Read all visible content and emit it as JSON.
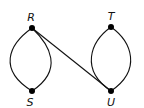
{
  "diagram": {
    "type": "graph",
    "nodes": [
      {
        "id": "R",
        "label": "R",
        "x": 32,
        "y": 28,
        "label_x": 31,
        "label_y": 21
      },
      {
        "id": "T",
        "label": "T",
        "x": 111,
        "y": 27,
        "label_x": 111,
        "label_y": 20
      },
      {
        "id": "S",
        "label": "S",
        "x": 32,
        "y": 91,
        "label_x": 30,
        "label_y": 106
      },
      {
        "id": "U",
        "label": "U",
        "x": 111,
        "y": 91,
        "label_x": 111,
        "label_y": 106
      }
    ],
    "edges": [
      {
        "from": "R",
        "to": "S",
        "shape": "curve-left"
      },
      {
        "from": "R",
        "to": "S",
        "shape": "curve-right"
      },
      {
        "from": "R",
        "to": "U",
        "shape": "straight"
      },
      {
        "from": "T",
        "to": "U",
        "shape": "curve-left"
      },
      {
        "from": "T",
        "to": "U",
        "shape": "curve-right"
      }
    ],
    "colors": {
      "stroke": "#111111",
      "node": "#000000",
      "background": "#ffffff"
    }
  }
}
